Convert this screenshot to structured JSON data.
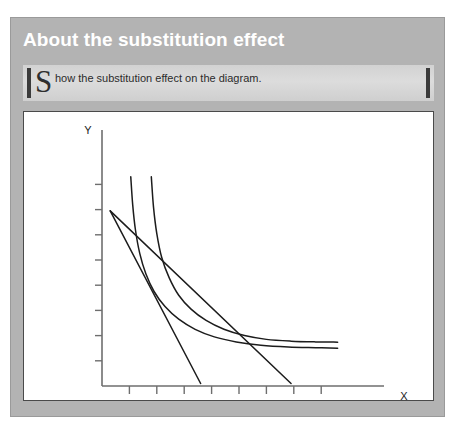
{
  "panel": {
    "title": "About the substitution effect"
  },
  "instruction": {
    "dropcap": "S",
    "text": "how the substitution effect on the diagram.",
    "full_text": "Show the substitution effect on the diagram."
  },
  "colors": {
    "panel_background": "#b3b3b3",
    "panel_border": "#9a9a9a",
    "title_text": "#ffffff",
    "callout_background": "#d8d8d8",
    "callout_bar": "#3b3b3b",
    "chart_background": "#ffffff",
    "chart_border": "#4a4a4a",
    "curve_stroke": "#1c1c1c",
    "axis_stroke": "#6e6e6e"
  },
  "chart_data": {
    "type": "line",
    "title": "",
    "xlabel": "X",
    "ylabel": "Y",
    "xlim": [
      0,
      10
    ],
    "ylim": [
      0,
      10
    ],
    "grid": false,
    "legend": "none",
    "x_ticks": [
      1,
      2,
      3,
      4,
      5,
      6,
      7,
      8
    ],
    "y_ticks": [
      1,
      2,
      3,
      4,
      5,
      6,
      7,
      8
    ],
    "x_tick_labels": [],
    "y_tick_labels": [],
    "series": [
      {
        "name": "indifference-curve-1",
        "kind": "indifference-curve",
        "points": [
          [
            1.05,
            8.3
          ],
          [
            1.12,
            7.2
          ],
          [
            1.22,
            6.2
          ],
          [
            1.38,
            5.25
          ],
          [
            1.6,
            4.45
          ],
          [
            1.9,
            3.75
          ],
          [
            2.3,
            3.15
          ],
          [
            2.8,
            2.65
          ],
          [
            3.4,
            2.25
          ],
          [
            4.1,
            1.95
          ],
          [
            4.9,
            1.75
          ],
          [
            5.8,
            1.62
          ],
          [
            6.8,
            1.55
          ],
          [
            7.8,
            1.52
          ],
          [
            8.6,
            1.5
          ]
        ]
      },
      {
        "name": "indifference-curve-2",
        "kind": "indifference-curve",
        "points": [
          [
            1.8,
            8.3
          ],
          [
            1.88,
            7.1
          ],
          [
            2.0,
            6.05
          ],
          [
            2.18,
            5.1
          ],
          [
            2.45,
            4.3
          ],
          [
            2.8,
            3.6
          ],
          [
            3.25,
            3.05
          ],
          [
            3.8,
            2.6
          ],
          [
            4.45,
            2.25
          ],
          [
            5.2,
            2.0
          ],
          [
            6.0,
            1.85
          ],
          [
            6.9,
            1.78
          ],
          [
            7.8,
            1.75
          ],
          [
            8.6,
            1.74
          ]
        ]
      },
      {
        "name": "budget-line-steep",
        "kind": "budget-line",
        "points": [
          [
            0.3,
            6.95
          ],
          [
            3.6,
            0.1
          ]
        ]
      },
      {
        "name": "budget-line-flat",
        "kind": "budget-line",
        "points": [
          [
            0.3,
            6.95
          ],
          [
            6.9,
            0.1
          ]
        ]
      }
    ],
    "annotations": []
  }
}
